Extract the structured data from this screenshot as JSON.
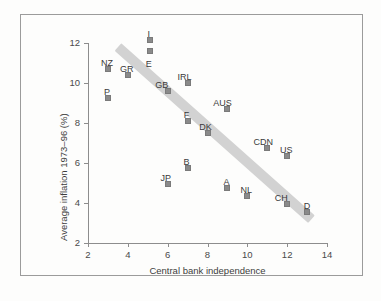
{
  "chart_data": {
    "type": "scatter",
    "title": "",
    "xlabel": "Central bank independence",
    "ylabel": "Average inflation 1973–96 (%)",
    "xlim": [
      2,
      14
    ],
    "ylim": [
      2,
      12
    ],
    "xticks": [
      "2",
      "4",
      "6",
      "8",
      "10",
      "12",
      "14"
    ],
    "yticks": [
      "2",
      "4",
      "6",
      "8",
      "10",
      "12"
    ],
    "grid": false,
    "legend": null,
    "marker_color": "#8a8a8a",
    "trend_band_color": "#d2d2d2",
    "trendline": {
      "label": "fitted trend band",
      "x_start": 3.5,
      "y_start": 11.8,
      "x_end": 13.2,
      "y_end": 3.2
    },
    "points": [
      {
        "label": "NZ",
        "x": 3,
        "y": 10.7,
        "label_dx": -1,
        "label_dy": -11
      },
      {
        "label": "GR",
        "x": 4,
        "y": 10.4,
        "label_dx": -1,
        "label_dy": -11
      },
      {
        "label": "P",
        "x": 3,
        "y": 9.25,
        "label_dx": -1,
        "label_dy": -11
      },
      {
        "label": "I",
        "x": 5.1,
        "y": 12.15,
        "label_dx": -1,
        "label_dy": -11
      },
      {
        "label": "E",
        "x": 5.1,
        "y": 11.6,
        "label_dx": -1,
        "label_dy": 8
      },
      {
        "label": "GB",
        "x": 6,
        "y": 9.6,
        "label_dx": -6,
        "label_dy": -11
      },
      {
        "label": "IRL",
        "x": 7,
        "y": 10.0,
        "label_dx": -3,
        "label_dy": -11
      },
      {
        "label": "F",
        "x": 7,
        "y": 8.1,
        "label_dx": -1,
        "label_dy": -11
      },
      {
        "label": "DK",
        "x": 8,
        "y": 7.5,
        "label_dx": -2,
        "label_dy": -11
      },
      {
        "label": "AUS",
        "x": 9,
        "y": 8.7,
        "label_dx": -5,
        "label_dy": -11
      },
      {
        "label": "B",
        "x": 7,
        "y": 5.75,
        "label_dx": -1,
        "label_dy": -11
      },
      {
        "label": "JP",
        "x": 6,
        "y": 4.95,
        "label_dx": -2,
        "label_dy": -11
      },
      {
        "label": "A",
        "x": 9,
        "y": 4.75,
        "label_dx": -1,
        "label_dy": -11
      },
      {
        "label": "NL",
        "x": 10,
        "y": 4.35,
        "label_dx": -1,
        "label_dy": -11
      },
      {
        "label": "CDN",
        "x": 11,
        "y": 6.75,
        "label_dx": -4,
        "label_dy": -11
      },
      {
        "label": "US",
        "x": 12,
        "y": 6.35,
        "label_dx": -1,
        "label_dy": -11
      },
      {
        "label": "CH",
        "x": 12,
        "y": 3.95,
        "label_dx": -6,
        "label_dy": -11
      },
      {
        "label": "D",
        "x": 13,
        "y": 3.55,
        "label_dx": 0,
        "label_dy": -11
      }
    ]
  }
}
